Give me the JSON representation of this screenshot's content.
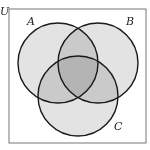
{
  "diagram": {
    "type": "venn-3",
    "universe": {
      "label": "U",
      "rect": {
        "x": 9,
        "y": 9,
        "width": 137,
        "height": 134
      },
      "stroke": "#777777",
      "fill": "#ffffff"
    },
    "sets": [
      {
        "id": "A",
        "label": "A",
        "cx": 58,
        "cy": 63,
        "r": 40,
        "label_x": 27,
        "label_y": 25
      },
      {
        "id": "B",
        "label": "B",
        "cx": 98,
        "cy": 63,
        "r": 40,
        "label_x": 126,
        "label_y": 25
      },
      {
        "id": "C",
        "label": "C",
        "cx": 78,
        "cy": 96,
        "r": 40,
        "label_x": 114,
        "label_y": 130
      }
    ],
    "universe_label_pos": {
      "x": 0,
      "y": 15
    },
    "colors": {
      "circle_fill": "#c8c8c8",
      "circle_opacity": 0.5,
      "circle_stroke": "#1a1a1a",
      "single_region": "#e2e2e2",
      "pair_region": "#c4c4c4",
      "triple_region": "#a5a5a5"
    }
  }
}
